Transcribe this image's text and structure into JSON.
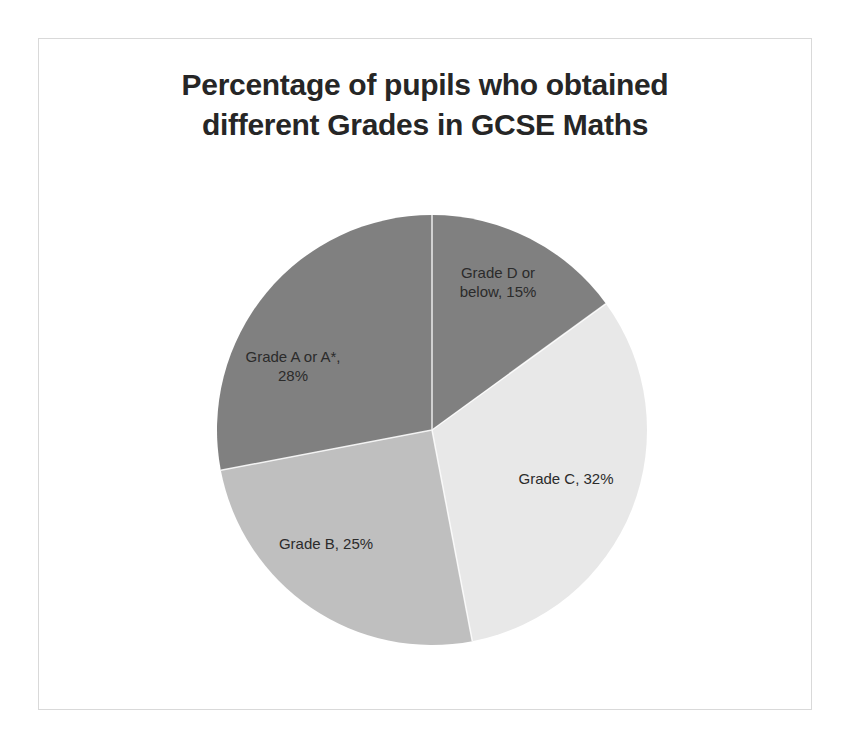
{
  "chart_data": {
    "type": "pie",
    "title": "Percentage of pupils who obtained\ndifferent Grades in GCSE Maths",
    "xlabel": "",
    "ylabel": "",
    "legend": "none",
    "grid": false,
    "units": "percent",
    "categories": [
      "Grade D or below",
      "Grade C",
      "Grade B",
      "Grade A or A*"
    ],
    "values": [
      15,
      32,
      25,
      28
    ],
    "start_angle_deg": 0,
    "direction": "clockwise",
    "slices": [
      {
        "name": "Grade D or below",
        "value": 15,
        "label": "Grade D or\nbelow, 15%",
        "color": "#808080",
        "start_deg": 0,
        "end_deg": 54
      },
      {
        "name": "Grade C",
        "value": 32,
        "label": "Grade C, 32%",
        "color": "#e8e8e8",
        "start_deg": 54,
        "end_deg": 169.2
      },
      {
        "name": "Grade B",
        "value": 25,
        "label": "Grade B, 25%",
        "color": "#bfbfbf",
        "start_deg": 169.2,
        "end_deg": 259.2
      },
      {
        "name": "Grade A or A*",
        "value": 28,
        "label": "Grade A or A*,\n28%",
        "color": "#808080",
        "start_deg": 259.2,
        "end_deg": 360
      }
    ]
  },
  "colors": {
    "frame_border": "#d9d9d9",
    "title_text": "#262626",
    "label_text": "#2b2b2b",
    "background": "#ffffff",
    "slice_divider": "#ffffff"
  }
}
